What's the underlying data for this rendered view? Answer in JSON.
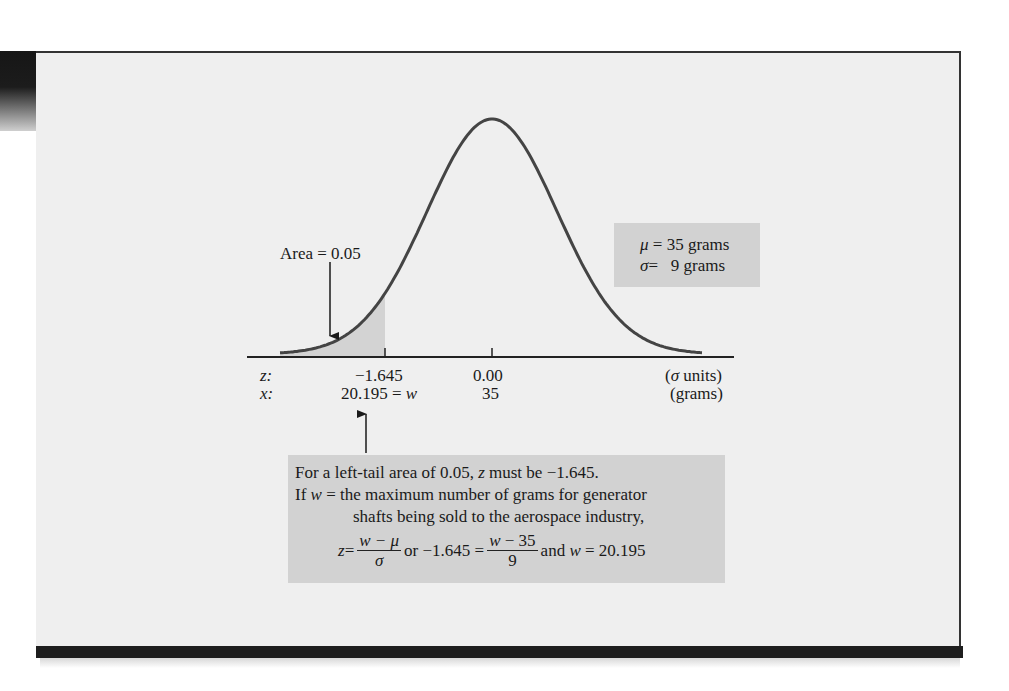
{
  "figure": {
    "area_label": "Area = 0.05",
    "params": {
      "mu_line": "μ = 35 grams",
      "mu_symbol": "μ",
      "mu_text": "= 35 grams",
      "sigma_symbol": "σ",
      "sigma_text": "=   9 grams"
    },
    "axis": {
      "z_row_label": "z:",
      "x_row_label": "x:",
      "z_ticks": [
        "−1.645",
        "0.00"
      ],
      "x_ticks": [
        "20.195 = w",
        "35"
      ],
      "z_units": "(σ units)",
      "z_units_symbol": "σ",
      "z_units_text": " units)",
      "x_units": "(grams)"
    },
    "note": {
      "line1_pre": "For a left-tail area of 0.05, ",
      "line1_var": "z",
      "line1_post": " must be −1.645.",
      "line2_pre": "If ",
      "line2_var": "w",
      "line2_post": " = the maximum number of grams for generator",
      "line3": "shafts being sold to the aerospace industry,",
      "formula": {
        "z": "z",
        "eq1": " =",
        "frac1_num": "w − μ",
        "frac1_den": "σ",
        "or_text": "or −1.645 =",
        "frac2_num": "w − 35",
        "frac2_den": "9",
        "and_text": "and ",
        "w": "w",
        "result": " = 20.195"
      }
    }
  },
  "chart_data": {
    "type": "area",
    "distribution": "normal",
    "mean": 35,
    "std_dev": 9,
    "shaded_region": {
      "tail": "left",
      "area": 0.05,
      "z_upper": -1.645,
      "x_upper": 20.195
    },
    "z_ticks": [
      -1.645,
      0.0
    ],
    "x_ticks": [
      20.195,
      35
    ],
    "xlabel_z": "σ units",
    "xlabel_x": "grams",
    "annotations": [
      "Area = 0.05",
      "μ = 35 grams",
      "σ = 9 grams",
      "z = (w − μ)/σ or −1.645 = (w − 35)/9 and w = 20.195"
    ]
  }
}
